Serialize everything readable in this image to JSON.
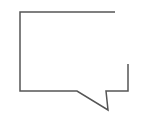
{
  "icon": {
    "name": "speech-bubble-icon",
    "stroke_color": "#555555",
    "background": "#ffffff"
  }
}
